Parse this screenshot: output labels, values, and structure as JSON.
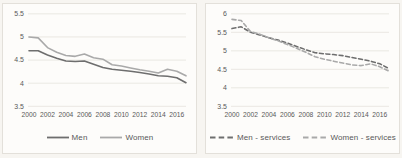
{
  "chart_data": [
    {
      "type": "line",
      "x": [
        2000,
        2001,
        2002,
        2003,
        2004,
        2005,
        2006,
        2007,
        2008,
        2009,
        2010,
        2011,
        2012,
        2013,
        2014,
        2015,
        2016,
        2017
      ],
      "xticks": [
        2000,
        2002,
        2004,
        2006,
        2008,
        2010,
        2012,
        2014,
        2016
      ],
      "ylim": [
        3.5,
        5.5
      ],
      "yticks": [
        3.5,
        4,
        4.5,
        5,
        5.5
      ],
      "grid": true,
      "legend_position": "bottom",
      "series": [
        {
          "name": "Men",
          "color": "#6e6e6e",
          "style": "solid",
          "values": [
            4.7,
            4.7,
            4.61,
            4.54,
            4.48,
            4.47,
            4.48,
            4.41,
            4.34,
            4.3,
            4.28,
            4.26,
            4.23,
            4.2,
            4.16,
            4.15,
            4.12,
            4.01
          ]
        },
        {
          "name": "Women",
          "color": "#a9a9a9",
          "style": "solid",
          "values": [
            5.0,
            4.98,
            4.77,
            4.67,
            4.6,
            4.58,
            4.63,
            4.55,
            4.52,
            4.4,
            4.37,
            4.33,
            4.29,
            4.26,
            4.22,
            4.3,
            4.26,
            4.16
          ]
        }
      ]
    },
    {
      "type": "line",
      "x": [
        2000,
        2001,
        2002,
        2003,
        2004,
        2005,
        2006,
        2007,
        2008,
        2009,
        2010,
        2011,
        2012,
        2013,
        2014,
        2015,
        2016,
        2017
      ],
      "xticks": [
        2000,
        2002,
        2004,
        2006,
        2008,
        2010,
        2012,
        2014,
        2016
      ],
      "ylim": [
        3.5,
        6
      ],
      "yticks": [
        3.5,
        4,
        4.5,
        5,
        5.5,
        6
      ],
      "grid": true,
      "legend_position": "bottom",
      "series": [
        {
          "name": "Men - services",
          "color": "#6e6e6e",
          "style": "dashed",
          "values": [
            5.6,
            5.65,
            5.5,
            5.43,
            5.35,
            5.29,
            5.21,
            5.12,
            5.03,
            4.95,
            4.92,
            4.9,
            4.87,
            4.82,
            4.77,
            4.72,
            4.65,
            4.52
          ]
        },
        {
          "name": "Women - services",
          "color": "#a9a9a9",
          "style": "dashed",
          "values": [
            5.85,
            5.82,
            5.52,
            5.45,
            5.35,
            5.27,
            5.17,
            5.07,
            4.96,
            4.84,
            4.77,
            4.72,
            4.67,
            4.62,
            4.6,
            4.65,
            4.57,
            4.45
          ]
        }
      ]
    }
  ],
  "style": {
    "grid_color": "#e7e5e0",
    "tick_label_color": "#595959",
    "panel_background": "#fdfcfa",
    "page_background": "#f7f5f1",
    "panel_border": "#e3e0da"
  }
}
